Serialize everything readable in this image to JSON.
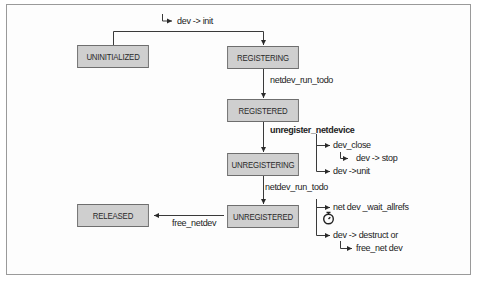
{
  "diagram": {
    "states": {
      "uninitialized": "UNINITIALIZED",
      "registering": "REGISTERING",
      "registered": "REGISTERED",
      "unregistering": "UNREGISTERING",
      "unregistered": "UNREGISTERED",
      "released": "RELEASED"
    },
    "transitions": {
      "init": "dev -> init",
      "run_todo_1": "netdev_run_todo",
      "unregister": "unregister_netdevice",
      "run_todo_2": "netdev_run_todo",
      "free": "free_netdev"
    },
    "side_calls": {
      "dev_close": "dev_close",
      "dev_stop": "dev -> stop",
      "dev_uninit": "dev ->unit",
      "wait_allrefs": "net dev _wait_allrefs",
      "destructor": "dev -> destruct or",
      "free_net_dev": "free_net dev"
    },
    "icons": {
      "timer": "stopwatch-icon"
    },
    "colors": {
      "box_fill": "#cfcfcf",
      "box_border": "#6e6e6e",
      "line": "#3a3a3a",
      "frame": "#9a9a9a"
    }
  }
}
